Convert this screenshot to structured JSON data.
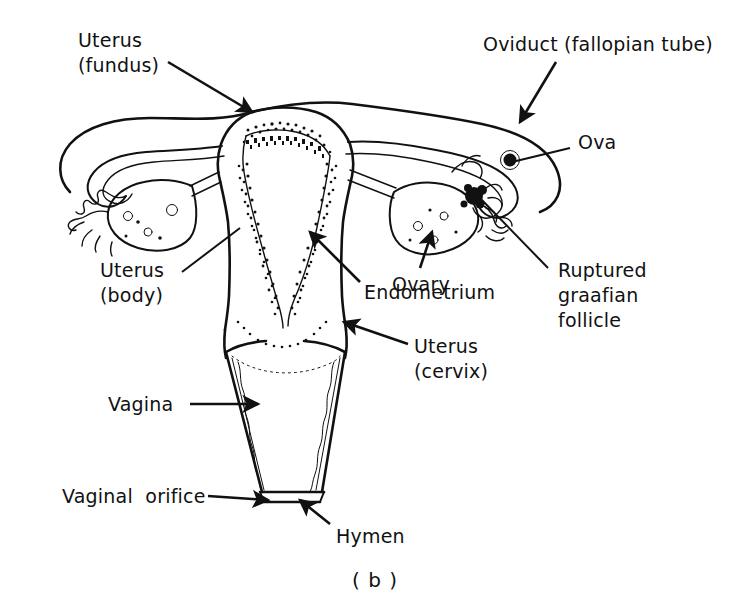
{
  "figure": {
    "caption": "( b )",
    "ink_color": "#111111",
    "background_color": "#ffffff"
  },
  "labels": [
    {
      "id": "uterus-fundus",
      "name": "label-uterus-fundus",
      "lines": [
        "Uterus",
        "(fundus)"
      ],
      "x": 78,
      "y": 28,
      "leader": {
        "type": "arrow",
        "x1": 168,
        "y1": 62,
        "x2": 252,
        "y2": 112
      }
    },
    {
      "id": "oviduct",
      "name": "label-oviduct",
      "lines": [
        "Oviduct (fallopian tube)"
      ],
      "x": 483,
      "y": 32,
      "leader": {
        "type": "arrow",
        "x1": 556,
        "y1": 62,
        "x2": 520,
        "y2": 122
      }
    },
    {
      "id": "ova",
      "name": "label-ova",
      "lines": [
        "Ova"
      ],
      "x": 578,
      "y": 130,
      "leader": {
        "type": "plain",
        "x1": 570,
        "y1": 148,
        "x2": 512,
        "y2": 162
      }
    },
    {
      "id": "ruptured-graafian-follicle",
      "name": "label-ruptured-graafian-follicle",
      "lines": [
        "Ruptured",
        "graafian",
        "follicle"
      ],
      "x": 558,
      "y": 258,
      "leader": {
        "type": "plain",
        "x1": 548,
        "y1": 268,
        "x2": 478,
        "y2": 196
      }
    },
    {
      "id": "ovary",
      "name": "label-ovary",
      "lines": [
        "Ovary"
      ],
      "x": 392,
      "y": 272,
      "leader": {
        "type": "arrow",
        "x1": 420,
        "y1": 268,
        "x2": 432,
        "y2": 232
      }
    },
    {
      "id": "endometrium",
      "name": "label-endometrium",
      "lines": [
        "Endometrium"
      ],
      "x": 364,
      "y": 280,
      "leader": {
        "type": "arrow",
        "x1": 360,
        "y1": 282,
        "x2": 310,
        "y2": 232
      }
    },
    {
      "id": "uterus-body",
      "name": "label-uterus-body",
      "lines": [
        "Uterus",
        "(body)"
      ],
      "x": 100,
      "y": 258,
      "leader": {
        "type": "plain",
        "x1": 182,
        "y1": 272,
        "x2": 240,
        "y2": 228
      }
    },
    {
      "id": "uterus-cervix",
      "name": "label-uterus-cervix",
      "lines": [
        "Uterus",
        "(cervix)"
      ],
      "x": 414,
      "y": 334,
      "leader": {
        "type": "arrow",
        "x1": 408,
        "y1": 344,
        "x2": 344,
        "y2": 322
      }
    },
    {
      "id": "vagina",
      "name": "label-vagina",
      "lines": [
        "Vagina"
      ],
      "x": 108,
      "y": 392,
      "leader": {
        "type": "arrow",
        "x1": 190,
        "y1": 404,
        "x2": 258,
        "y2": 404
      }
    },
    {
      "id": "vaginal-orifice",
      "name": "label-vaginal-orifice",
      "lines": [
        "Vaginal  orifice"
      ],
      "x": 62,
      "y": 484,
      "leader": {
        "type": "arrow",
        "x1": 208,
        "y1": 496,
        "x2": 268,
        "y2": 500
      }
    },
    {
      "id": "hymen",
      "name": "label-hymen",
      "lines": [
        "Hymen"
      ],
      "x": 336,
      "y": 524,
      "leader": {
        "type": "arrow",
        "x1": 330,
        "y1": 524,
        "x2": 300,
        "y2": 500
      }
    }
  ],
  "caption_position": {
    "x": 352,
    "y": 568
  }
}
